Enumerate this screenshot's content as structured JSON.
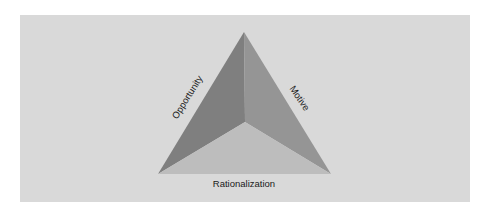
{
  "diagram": {
    "vertices": {
      "top": [
        244,
        32
      ],
      "left": [
        158,
        174
      ],
      "right": [
        331,
        174
      ],
      "center": [
        245,
        122
      ]
    },
    "faces": [
      {
        "name": "left-face",
        "color": "#7f7f7f"
      },
      {
        "name": "right-face",
        "color": "#959595"
      },
      {
        "name": "bottom-face",
        "color": "#bdbdbd"
      }
    ],
    "labels": {
      "left": "Opportunity",
      "right": "Motive",
      "bottom": "Rationalization"
    },
    "panel_color": "#d9d9d9"
  }
}
